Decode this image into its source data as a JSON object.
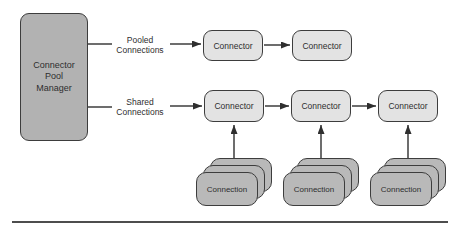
{
  "diagram": {
    "title_semantic": "Connector pool architecture diagram",
    "colors": {
      "background": "#ffffff",
      "manager_fill": "#b2b2b2",
      "connector_fill": "#e3e3e3",
      "connection_fill": "#b9b9b9",
      "box_border": "#3d3d3d",
      "arrow_line": "#2f2f2f",
      "bottom_rule": "#4d4d4d"
    },
    "manager": {
      "label": "Connector\nPool\nManager"
    },
    "flows": {
      "pooled": {
        "label": "Pooled\nConnections"
      },
      "shared": {
        "label": "Shared\nConnections"
      }
    },
    "pooled_row": {
      "connectors": [
        "Connector",
        "Connector"
      ]
    },
    "shared_row": {
      "connectors": [
        "Connector",
        "Connector",
        "Connector"
      ]
    },
    "connection_stacks": [
      {
        "label": "Connection",
        "stacked_count": 3
      },
      {
        "label": "Connection",
        "stacked_count": 3
      },
      {
        "label": "Connection",
        "stacked_count": 3
      }
    ]
  }
}
